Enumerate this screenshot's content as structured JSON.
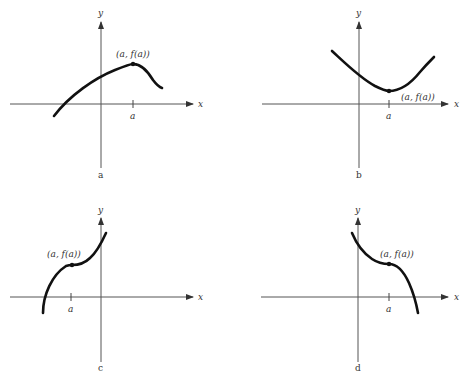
{
  "panels": [
    {
      "id": "a",
      "caption": "a",
      "x_label": "x",
      "y_label": "y",
      "tick_label": "a",
      "point_label": "(a, f(a))",
      "description": "Concave-down curve with a local maximum at (a, f(a))"
    },
    {
      "id": "b",
      "caption": "b",
      "x_label": "x",
      "y_label": "y",
      "tick_label": "a",
      "point_label": "(a, f(a))",
      "description": "Concave-up curve with a local minimum at (a, f(a))"
    },
    {
      "id": "c",
      "caption": "c",
      "x_label": "x",
      "y_label": "y",
      "tick_label": "a",
      "point_label": "(a, f(a))",
      "description": "Increasing curve with a horizontal inflection point at (a, f(a))"
    },
    {
      "id": "d",
      "caption": "d",
      "x_label": "x",
      "y_label": "y",
      "tick_label": "a",
      "point_label": "(a, f(a))",
      "description": "Decreasing curve with a horizontal inflection point at (a, f(a))"
    }
  ],
  "colors": {
    "curve": "#111111",
    "axis": "#555555",
    "text": "#333333",
    "background": "#ffffff"
  }
}
